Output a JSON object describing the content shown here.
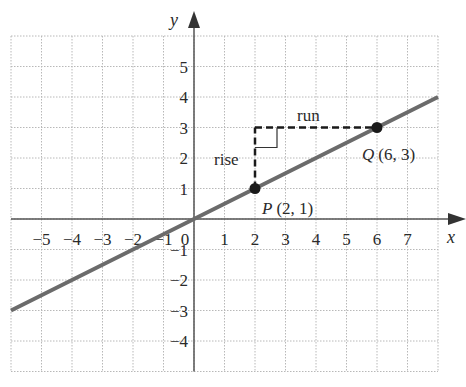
{
  "chart_data": {
    "type": "line",
    "title": "",
    "xlabel": "x",
    "ylabel": "y",
    "xlim": [
      -6,
      8
    ],
    "ylim": [
      -5,
      6
    ],
    "grid": true,
    "x_ticks": [
      "−5",
      "−4",
      "−3",
      "−2",
      "−1",
      "0",
      "1",
      "2",
      "3",
      "4",
      "5",
      "6",
      "7"
    ],
    "x_tick_values": [
      -5,
      -4,
      -3,
      -2,
      -1,
      0,
      1,
      2,
      3,
      4,
      5,
      6,
      7
    ],
    "y_ticks": [
      "5",
      "4",
      "3",
      "2",
      "1",
      "−1",
      "−2",
      "−3",
      "−4"
    ],
    "y_tick_values": [
      5,
      4,
      3,
      2,
      1,
      -1,
      -2,
      -3,
      -4
    ],
    "series": [
      {
        "name": "line through P and Q",
        "equation": "y = x/2",
        "x": [
          -6,
          8
        ],
        "y": [
          -3,
          4
        ],
        "color": "#6b6b6b"
      }
    ],
    "points": [
      {
        "name": "P",
        "label": "P",
        "coords": "(2, 1)",
        "x": 2,
        "y": 1
      },
      {
        "name": "Q",
        "label": "Q",
        "coords": "(6, 3)",
        "x": 6,
        "y": 3
      }
    ],
    "annotations": [
      {
        "text": "rise",
        "type": "vertical-dashed",
        "from": [
          2,
          1
        ],
        "to": [
          2,
          3
        ]
      },
      {
        "text": "run",
        "type": "horizontal-dashed",
        "from": [
          2,
          3
        ],
        "to": [
          6,
          3
        ]
      }
    ],
    "legend": null
  },
  "labels": {
    "x_axis": "x",
    "y_axis": "y",
    "rise": "rise",
    "run": "run",
    "p_name": "P",
    "p_coords": "(2, 1)",
    "q_name": "Q",
    "q_coords": "(6, 3)",
    "origin": "0"
  },
  "colors": {
    "line": "#6b6b6b",
    "axis": "#555555",
    "grid": "#b8b8b8",
    "point": "#1a1a1a",
    "dashed": "#1a1a1a"
  }
}
